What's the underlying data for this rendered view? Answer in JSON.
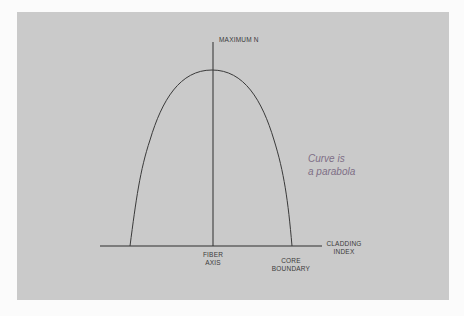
{
  "diagram": {
    "labels": {
      "maximum": "MAXIMUM N",
      "fiber_axis_line1": "FIBER",
      "fiber_axis_line2": "AXIS",
      "core_boundary_line1": "CORE",
      "core_boundary_line2": "BOUNDARY",
      "cladding_line1": "CLADDING",
      "cladding_line2": "INDEX"
    },
    "annotation": {
      "line1": "Curve is",
      "line2": "a parabola"
    },
    "colors": {
      "panel": "#cacaca",
      "line": "#2e2e2e",
      "annotation": "#7e6e86",
      "background": "#fbfbfb"
    },
    "geometry": {
      "axis_line": {
        "x1": 100,
        "x2": 322,
        "y": 246
      },
      "vertical_axis": {
        "x": 213,
        "y1": 42,
        "y2": 246
      },
      "curve": {
        "left_x": 130,
        "right_x": 292,
        "base_y": 246,
        "peak_x": 212,
        "peak_y": 70
      }
    }
  }
}
